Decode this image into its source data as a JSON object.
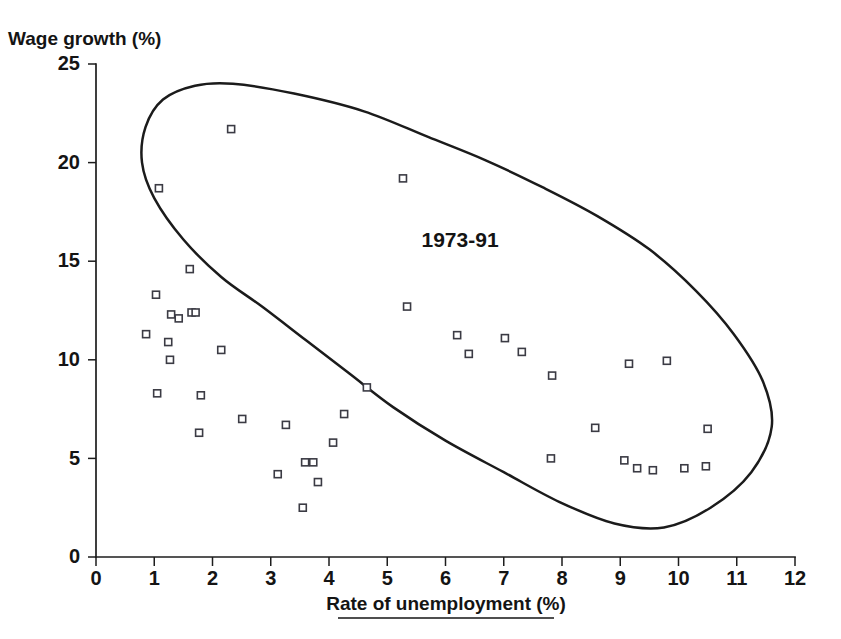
{
  "chart_data": {
    "type": "scatter",
    "title": "",
    "xlabel": "Rate of unemployment (%)",
    "ylabel": "Wage growth (%)",
    "xlim": [
      0,
      12
    ],
    "ylim": [
      0,
      25
    ],
    "xticks": [
      0,
      1,
      2,
      3,
      4,
      5,
      6,
      7,
      8,
      9,
      10,
      11,
      12
    ],
    "yticks": [
      0,
      5,
      10,
      15,
      20,
      25
    ],
    "xtick_labels": [
      "0",
      "1",
      "2",
      "3",
      "4",
      "5",
      "6",
      "7",
      "8",
      "9",
      "10",
      "11",
      "12"
    ],
    "ytick_labels": [
      "0",
      "5",
      "10",
      "15",
      "20",
      "25"
    ],
    "grid": false,
    "legend": null,
    "annotations": [
      {
        "text": "1973-91",
        "x": 6.25,
        "y": 15.7
      }
    ],
    "series": [
      {
        "name": "Unemployment vs wage growth",
        "marker": "open-square",
        "points": [
          {
            "x": 1.08,
            "y": 18.7
          },
          {
            "x": 2.32,
            "y": 21.7
          },
          {
            "x": 5.27,
            "y": 19.2
          },
          {
            "x": 1.61,
            "y": 14.6
          },
          {
            "x": 1.03,
            "y": 13.3
          },
          {
            "x": 1.29,
            "y": 12.3
          },
          {
            "x": 1.42,
            "y": 12.1
          },
          {
            "x": 1.64,
            "y": 12.4
          },
          {
            "x": 1.71,
            "y": 12.4
          },
          {
            "x": 0.86,
            "y": 11.3
          },
          {
            "x": 1.24,
            "y": 10.9
          },
          {
            "x": 1.27,
            "y": 10.0
          },
          {
            "x": 2.15,
            "y": 10.5
          },
          {
            "x": 1.05,
            "y": 8.3
          },
          {
            "x": 1.8,
            "y": 8.2
          },
          {
            "x": 1.77,
            "y": 6.3
          },
          {
            "x": 2.51,
            "y": 7.0
          },
          {
            "x": 3.26,
            "y": 6.7
          },
          {
            "x": 3.12,
            "y": 4.2
          },
          {
            "x": 3.59,
            "y": 4.8
          },
          {
            "x": 3.73,
            "y": 4.8
          },
          {
            "x": 3.55,
            "y": 2.5
          },
          {
            "x": 3.81,
            "y": 3.8
          },
          {
            "x": 4.07,
            "y": 5.8
          },
          {
            "x": 4.26,
            "y": 7.25
          },
          {
            "x": 4.65,
            "y": 8.6
          },
          {
            "x": 5.34,
            "y": 12.7
          },
          {
            "x": 6.2,
            "y": 11.25
          },
          {
            "x": 6.4,
            "y": 10.3
          },
          {
            "x": 7.02,
            "y": 11.1
          },
          {
            "x": 7.31,
            "y": 10.4
          },
          {
            "x": 7.83,
            "y": 9.2
          },
          {
            "x": 7.81,
            "y": 5.0
          },
          {
            "x": 8.57,
            "y": 6.55
          },
          {
            "x": 9.15,
            "y": 9.8
          },
          {
            "x": 9.8,
            "y": 9.95
          },
          {
            "x": 9.07,
            "y": 4.9
          },
          {
            "x": 9.29,
            "y": 4.5
          },
          {
            "x": 9.56,
            "y": 4.4
          },
          {
            "x": 10.1,
            "y": 4.5
          },
          {
            "x": 10.47,
            "y": 4.6
          },
          {
            "x": 10.5,
            "y": 6.5
          }
        ]
      }
    ],
    "envelope": {
      "name": "1973-91 hand-drawn boundary",
      "closed": true,
      "points_data": [
        {
          "x": 0.79,
          "y": 20.0
        },
        {
          "x": 0.85,
          "y": 21.8
        },
        {
          "x": 1.15,
          "y": 23.2
        },
        {
          "x": 1.7,
          "y": 23.9
        },
        {
          "x": 2.35,
          "y": 24.0
        },
        {
          "x": 3.4,
          "y": 23.5
        },
        {
          "x": 4.6,
          "y": 22.6
        },
        {
          "x": 5.7,
          "y": 21.3
        },
        {
          "x": 6.7,
          "y": 20.1
        },
        {
          "x": 7.7,
          "y": 18.7
        },
        {
          "x": 8.6,
          "y": 17.3
        },
        {
          "x": 9.5,
          "y": 15.6
        },
        {
          "x": 10.3,
          "y": 13.5
        },
        {
          "x": 10.95,
          "y": 11.3
        },
        {
          "x": 11.45,
          "y": 8.9
        },
        {
          "x": 11.6,
          "y": 6.6
        },
        {
          "x": 11.25,
          "y": 4.3
        },
        {
          "x": 10.55,
          "y": 2.5
        },
        {
          "x": 9.75,
          "y": 1.5
        },
        {
          "x": 8.9,
          "y": 1.7
        },
        {
          "x": 7.95,
          "y": 2.8
        },
        {
          "x": 7.0,
          "y": 4.3
        },
        {
          "x": 6.0,
          "y": 5.9
        },
        {
          "x": 5.1,
          "y": 7.6
        },
        {
          "x": 4.35,
          "y": 9.3
        },
        {
          "x": 3.6,
          "y": 11.0
        },
        {
          "x": 2.85,
          "y": 12.7
        },
        {
          "x": 2.15,
          "y": 14.2
        },
        {
          "x": 1.5,
          "y": 16.1
        },
        {
          "x": 1.0,
          "y": 18.2
        }
      ]
    }
  }
}
